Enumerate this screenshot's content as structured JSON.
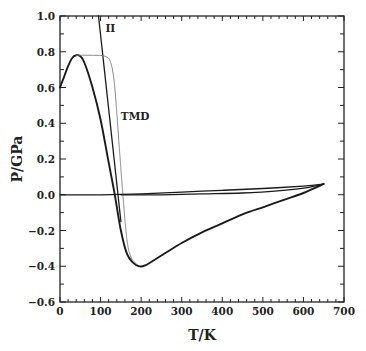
{
  "chart_data": {
    "type": "line",
    "title": "",
    "xlabel": "T/K",
    "ylabel": "P/GPa",
    "xlim": [
      0,
      700
    ],
    "ylim": [
      -0.6,
      1.0
    ],
    "grid": false,
    "legend": null,
    "x_ticks": [
      0,
      100,
      200,
      300,
      400,
      500,
      600,
      700
    ],
    "x_tick_labels": [
      "0",
      "100",
      "200",
      "300",
      "400",
      "500",
      "600",
      "700"
    ],
    "y_ticks": [
      -0.6,
      -0.4,
      -0.2,
      0.0,
      0.2,
      0.4,
      0.6,
      0.8,
      1.0
    ],
    "y_tick_labels": [
      "-0.6",
      "-0.4",
      "-0.2",
      "0.0",
      "0.2",
      "0.4",
      "0.6",
      "0.8",
      "1.0"
    ],
    "annotations": [
      {
        "text": "II",
        "x": 112,
        "y": 0.91
      },
      {
        "text": "TMD",
        "x": 150,
        "y": 0.42
      }
    ],
    "series": [
      {
        "name": "liquid-spinodal",
        "style": "solid-thick",
        "points": [
          [
            0,
            0.6
          ],
          [
            10,
            0.66
          ],
          [
            20,
            0.72
          ],
          [
            30,
            0.765
          ],
          [
            40,
            0.78
          ],
          [
            50,
            0.775
          ],
          [
            60,
            0.74
          ],
          [
            80,
            0.6
          ],
          [
            100,
            0.42
          ],
          [
            120,
            0.18
          ],
          [
            135,
            0.0
          ],
          [
            150,
            -0.2
          ],
          [
            165,
            -0.33
          ],
          [
            180,
            -0.38
          ],
          [
            195,
            -0.4
          ],
          [
            210,
            -0.395
          ],
          [
            250,
            -0.34
          ],
          [
            300,
            -0.27
          ],
          [
            350,
            -0.21
          ],
          [
            400,
            -0.16
          ],
          [
            450,
            -0.11
          ],
          [
            500,
            -0.07
          ],
          [
            550,
            -0.03
          ],
          [
            600,
            0.01
          ],
          [
            650,
            0.06
          ]
        ]
      },
      {
        "name": "II",
        "style": "solid",
        "points": [
          [
            95,
            1.0
          ],
          [
            143,
            0.0
          ],
          [
            150,
            -0.15
          ]
        ]
      },
      {
        "name": "TMD",
        "style": "dotted-thin",
        "points": [
          [
            40,
            0.78
          ],
          [
            80,
            0.78
          ],
          [
            110,
            0.775
          ],
          [
            125,
            0.74
          ],
          [
            135,
            0.6
          ],
          [
            145,
            0.3
          ],
          [
            155,
            0.0
          ],
          [
            165,
            -0.25
          ],
          [
            175,
            -0.35
          ],
          [
            190,
            -0.39
          ]
        ]
      },
      {
        "name": "upper-near-zero",
        "style": "solid",
        "points": [
          [
            0,
            0.0
          ],
          [
            100,
            0.0
          ],
          [
            200,
            0.005
          ],
          [
            300,
            0.015
          ],
          [
            400,
            0.025
          ],
          [
            500,
            0.035
          ],
          [
            600,
            0.048
          ],
          [
            650,
            0.06
          ]
        ]
      },
      {
        "name": "lower-near-zero",
        "style": "solid",
        "points": [
          [
            150,
            0.0
          ],
          [
            250,
            0.0
          ],
          [
            350,
            0.005
          ],
          [
            450,
            0.01
          ],
          [
            550,
            0.025
          ],
          [
            610,
            0.04
          ],
          [
            650,
            0.06
          ]
        ]
      }
    ]
  }
}
